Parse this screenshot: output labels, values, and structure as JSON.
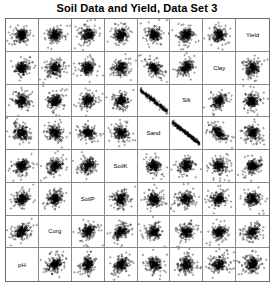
{
  "chart_data": {
    "type": "scatter",
    "title": "Soil Data and Yield, Data Set 3",
    "subtitle": "",
    "xlabel": "",
    "ylabel": "",
    "layout": "scatterplot-matrix",
    "matrix_size": 8,
    "diagonal_direction": "anti-diagonal",
    "grid": true,
    "legend": "none",
    "marker": "open-circle",
    "marker_color": "#000000",
    "variables": [
      "pH",
      "Corg",
      "SoilP",
      "SoilK",
      "Sand",
      "Silt",
      "Clay",
      "Yield"
    ],
    "diagonal_cells": [
      {
        "row": 1,
        "col": 8,
        "label": "Yield"
      },
      {
        "row": 2,
        "col": 7,
        "label": "Clay"
      },
      {
        "row": 3,
        "col": 6,
        "label": "Silt"
      },
      {
        "row": 4,
        "col": 5,
        "label": "Sand"
      },
      {
        "row": 5,
        "col": 4,
        "label": "SoilK"
      },
      {
        "row": 6,
        "col": 3,
        "label": "SoilP"
      },
      {
        "row": 7,
        "col": 2,
        "label": "Corg"
      },
      {
        "row": 8,
        "col": 1,
        "label": "pH"
      }
    ],
    "row_variables": [
      "Yield",
      "Clay",
      "Silt",
      "Sand",
      "SoilK",
      "SoilP",
      "Corg",
      "pH"
    ],
    "col_variables": [
      "pH",
      "Corg",
      "SoilP",
      "SoilK",
      "Sand",
      "Silt",
      "Clay",
      "Yield"
    ],
    "n_points": 220,
    "panel_correlations": [
      [
        0.18,
        0.22,
        0.12,
        0.2,
        -0.1,
        0.1,
        0.05,
        null
      ],
      [
        0.15,
        0.18,
        0.1,
        0.14,
        -0.55,
        0.35,
        null,
        0.05
      ],
      [
        0.1,
        0.12,
        0.08,
        0.16,
        -0.92,
        null,
        0.35,
        0.1
      ],
      [
        -0.12,
        -0.15,
        -0.1,
        -0.18,
        null,
        -0.92,
        -0.55,
        -0.1
      ],
      [
        0.25,
        0.3,
        0.28,
        null,
        -0.18,
        0.16,
        0.14,
        0.2
      ],
      [
        0.2,
        0.26,
        null,
        0.28,
        -0.1,
        0.08,
        0.1,
        0.12
      ],
      [
        0.3,
        null,
        0.26,
        0.3,
        -0.15,
        0.12,
        0.18,
        0.22
      ],
      [
        null,
        0.3,
        0.2,
        0.25,
        -0.12,
        0.1,
        0.15,
        0.18
      ]
    ]
  },
  "chart": {
    "title": "Soil Data and Yield, Data Set 3"
  }
}
